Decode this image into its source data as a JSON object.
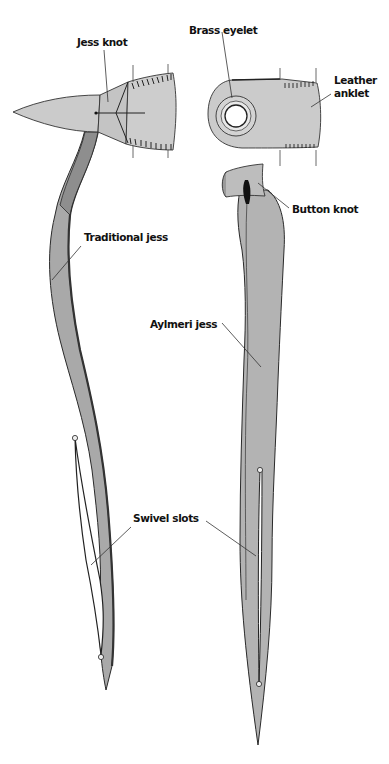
{
  "diagram": {
    "type": "illustration",
    "labels": {
      "jess_knot": "Jess knot",
      "brass_eyelet": "Brass eyelet",
      "leather_anklet_line1": "Leather",
      "leather_anklet_line2": "anklet",
      "button_knot": "Button knot",
      "traditional_jess": "Traditional jess",
      "aylmeri_jess": "Aylmeri jess",
      "swivel_slots": "Swivel slots"
    },
    "colors": {
      "leather_light": "#c9c9c9",
      "leather_mid": "#a8a8a8",
      "leather_dark": "#8a8a8a",
      "outline": "#2a2a2a",
      "eyelet_inner": "#ffffff",
      "background": "#ffffff"
    }
  }
}
